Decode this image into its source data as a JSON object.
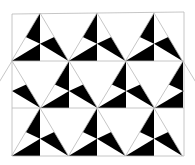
{
  "figure": {
    "width": 195,
    "height": 165,
    "colors": {
      "background": "#ffffff",
      "fill": "#000000",
      "line": "#b8b8b8"
    },
    "frame": {
      "x1": 12,
      "y1": 13,
      "x2": 184,
      "y2": 156
    },
    "row_lines_y": [
      61,
      108
    ],
    "rows": [
      {
        "top": 13,
        "bottom": 61,
        "apex_x": [
          40,
          97,
          154
        ]
      },
      {
        "top": 61,
        "bottom": 108,
        "apex_x": [
          12,
          69,
          126,
          183
        ]
      },
      {
        "top": 108,
        "bottom": 156,
        "apex_x": [
          40,
          97,
          154
        ]
      }
    ],
    "half_width": 28.5
  }
}
